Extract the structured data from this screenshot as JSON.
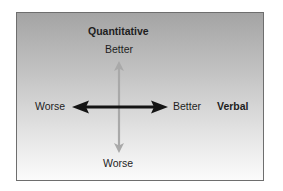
{
  "diagram": {
    "axes": {
      "vertical": {
        "title": "Quantitative",
        "top_label": "Better",
        "bottom_label": "Worse",
        "color": "#a9a9a9"
      },
      "horizontal": {
        "title": "Verbal",
        "left_label": "Worse",
        "right_label": "Better",
        "color": "#141414"
      }
    },
    "background": {
      "gradient_top": "#a4a4a4",
      "gradient_bottom": "#fbfbfb",
      "border": "#6e6e6e"
    }
  }
}
